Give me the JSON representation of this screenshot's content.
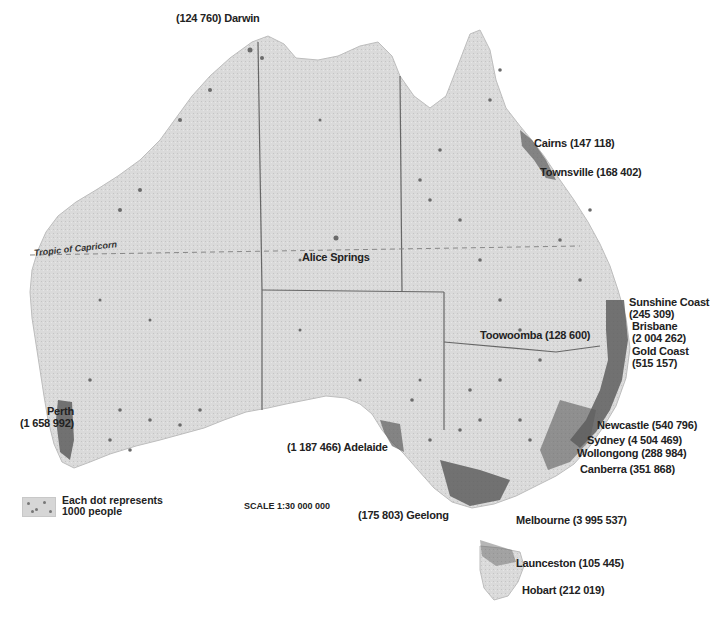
{
  "map": {
    "subject": "Population distribution of Australia",
    "tropic_label": "Tropic of Capricorn",
    "legend": {
      "line1": "Each dot represents",
      "line2": "1000 people"
    },
    "scale": "SCALE 1:30 000 000",
    "colors": {
      "land": "#d9d9d9",
      "dots": "#6a6a6a",
      "dense": "#555555",
      "borders": "#555555",
      "text": "#222222"
    },
    "cities": [
      {
        "name": "Darwin",
        "label": "(124 760) Darwin",
        "population": 124760
      },
      {
        "name": "Cairns",
        "label": "Cairns (147 118)",
        "population": 147118
      },
      {
        "name": "Townsville",
        "label": "Townsville (168 402)",
        "population": 168402
      },
      {
        "name": "Alice Springs",
        "label": "Alice Springs"
      },
      {
        "name": "Sunshine Coast",
        "label_line1": "Sunshine Coast",
        "label_line2": "(245 309)",
        "population": 245309
      },
      {
        "name": "Brisbane",
        "label_line1": "Brisbane",
        "label_line2": "(2 004 262)",
        "population": 2004262
      },
      {
        "name": "Gold Coast",
        "label_line1": "Gold Coast",
        "label_line2": "(515 157)",
        "population": 515157
      },
      {
        "name": "Toowoomba",
        "label": "Toowoomba (128 600)",
        "population": 128600
      },
      {
        "name": "Newcastle",
        "label": "Newcastle (540 796)",
        "population": 540796
      },
      {
        "name": "Sydney",
        "label": "Sydney (4 504 469)",
        "population": 4504469
      },
      {
        "name": "Wollongong",
        "label": "Wollongong (288 984)",
        "population": 288984
      },
      {
        "name": "Canberra",
        "label": "Canberra (351 868)",
        "population": 351868
      },
      {
        "name": "Melbourne",
        "label": "Melbourne (3 995 537)",
        "population": 3995537
      },
      {
        "name": "Geelong",
        "label": "(175 803) Geelong",
        "population": 175803
      },
      {
        "name": "Adelaide",
        "label": "(1 187 466) Adelaide",
        "population": 1187466
      },
      {
        "name": "Perth",
        "label_line1": "Perth",
        "label_line2": "(1 658 992)",
        "population": 1658992
      },
      {
        "name": "Launceston",
        "label": "Launceston (105 445)",
        "population": 105445
      },
      {
        "name": "Hobart",
        "label": "Hobart (212 019)",
        "population": 212019
      }
    ]
  }
}
